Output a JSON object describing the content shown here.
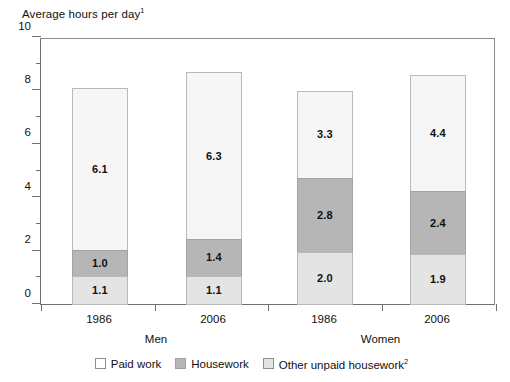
{
  "chart": {
    "axis_title": "Average hours per day",
    "axis_title_superscript": "1"
  },
  "chart_data": {
    "type": "bar",
    "subtype": "stacked-bar",
    "title": "Average hours per day",
    "title_footnote_marker": "1",
    "xlabel": "",
    "ylabel": "Average hours per day",
    "ylim": [
      0,
      10
    ],
    "ytick_values": [
      0,
      2,
      4,
      6,
      8,
      10
    ],
    "ytick_labels": [
      "0",
      "2",
      "4",
      "6",
      "8",
      "10"
    ],
    "yminor_tick_values": [
      1,
      3,
      5,
      7,
      9
    ],
    "grid": false,
    "legend_position": "bottom",
    "categories": [
      "1986",
      "2006",
      "1986",
      "2006"
    ],
    "groups": [
      {
        "label": "Men",
        "categories": [
          "1986",
          "2006"
        ]
      },
      {
        "label": "Women",
        "categories": [
          "1986",
          "2006"
        ]
      }
    ],
    "series": [
      {
        "name": "Paid work",
        "color": "#e4e4e4",
        "values": [
          1.1,
          1.1,
          2.0,
          1.9
        ]
      },
      {
        "name": "Housework",
        "color": "#b6b6b6",
        "values": [
          1.0,
          1.4,
          2.8,
          2.4
        ]
      },
      {
        "name": "Other unpaid housework",
        "color": "#f6f6f6",
        "footnote_marker": "2",
        "values": [
          6.1,
          6.3,
          3.3,
          4.4
        ]
      }
    ],
    "totals": [
      8.2,
      8.8,
      8.1,
      8.7
    ],
    "bars": [
      {
        "group": "Men",
        "category": "1986",
        "total": 8.2,
        "segments": [
          {
            "name": "Paid work",
            "value": 1.1,
            "label": "1.1"
          },
          {
            "name": "Housework",
            "value": 1.0,
            "label": "1.0"
          },
          {
            "name": "Other unpaid housework",
            "value": 6.1,
            "label": "6.1"
          }
        ]
      },
      {
        "group": "Men",
        "category": "2006",
        "total": 8.8,
        "segments": [
          {
            "name": "Paid work",
            "value": 1.1,
            "label": "1.1"
          },
          {
            "name": "Housework",
            "value": 1.4,
            "label": "1.4"
          },
          {
            "name": "Other unpaid housework",
            "value": 6.3,
            "label": "6.3"
          }
        ]
      },
      {
        "group": "Women",
        "category": "1986",
        "total": 8.1,
        "segments": [
          {
            "name": "Paid work",
            "value": 2.0,
            "label": "2.0"
          },
          {
            "name": "Housework",
            "value": 2.8,
            "label": "2.8"
          },
          {
            "name": "Other unpaid housework",
            "value": 3.3,
            "label": "3.3"
          }
        ]
      },
      {
        "group": "Women",
        "category": "2006",
        "total": 8.7,
        "segments": [
          {
            "name": "Paid work",
            "value": 1.9,
            "label": "1.9"
          },
          {
            "name": "Housework",
            "value": 2.4,
            "label": "2.4"
          },
          {
            "name": "Other unpaid housework",
            "value": 4.4,
            "label": "4.4"
          }
        ]
      }
    ]
  },
  "legend": {
    "items": [
      {
        "label": "Paid work",
        "swatch": "paid",
        "footnote_marker": ""
      },
      {
        "label": "Housework",
        "swatch": "housework",
        "footnote_marker": ""
      },
      {
        "label": "Other unpaid housework",
        "swatch": "other",
        "footnote_marker": "2"
      }
    ]
  }
}
